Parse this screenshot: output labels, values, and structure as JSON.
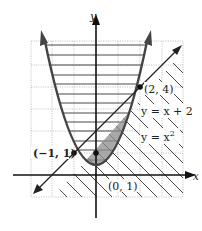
{
  "diagram": {
    "axes": {
      "x_label": "x",
      "y_label": "y"
    },
    "curves": [
      {
        "name": "parabola",
        "label_prefix": "y = x",
        "label_exponent": "2"
      },
      {
        "name": "line",
        "label": "y = x + 2"
      }
    ],
    "points": [
      {
        "label": "(−1, 1)",
        "x": -1,
        "y": 1
      },
      {
        "label": "(0, 1)",
        "x": 0,
        "y": 1
      },
      {
        "label": "(2, 4)",
        "x": 2,
        "y": 4
      }
    ],
    "shaded_region": "between y = x + 2 and y = x^2 for −1 ≤ x ≤ 2",
    "colors": {
      "curve": "#444444",
      "shade": "#9a9a9a",
      "grid": "#b0b0b0",
      "hatch": "#333333"
    }
  }
}
